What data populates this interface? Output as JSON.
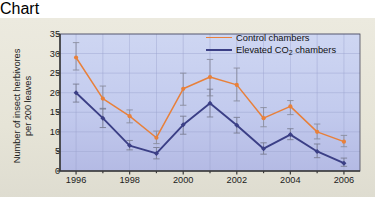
{
  "chart_data": {
    "type": "line",
    "title": "",
    "xlabel": "Year",
    "ylabel_line1": "Number of insect herbivores",
    "ylabel_line2": "per 200 leaves",
    "x": [
      1996,
      1997,
      1998,
      1999,
      2000,
      2001,
      2002,
      2003,
      2004,
      2005,
      2006
    ],
    "xtick_labels": [
      "1996",
      "1998",
      "2000",
      "2002",
      "2004",
      "2006"
    ],
    "xtick_values": [
      1996,
      1998,
      2000,
      2002,
      2004,
      2006
    ],
    "xlim": [
      1995.4,
      2006.6
    ],
    "ytick_labels": [
      "0",
      "5",
      "10",
      "15",
      "20",
      "25",
      "30",
      "35"
    ],
    "ytick_values": [
      0,
      5,
      10,
      15,
      20,
      25,
      30,
      35
    ],
    "ylim": [
      0,
      35
    ],
    "grid": true,
    "legend_position": "top-right",
    "series": [
      {
        "name": "Control chambers",
        "color": "#e8803a",
        "marker": "circle",
        "values": [
          29.0,
          18.5,
          14.0,
          8.5,
          21.0,
          24.0,
          22.0,
          13.5,
          16.5,
          10.0,
          7.5
        ],
        "err_low": [
          25.8,
          15.8,
          12.3,
          7.0,
          16.8,
          19.2,
          17.9,
          11.3,
          14.4,
          8.2,
          6.2
        ],
        "err_high": [
          32.8,
          21.7,
          15.6,
          10.2,
          25.0,
          28.5,
          26.3,
          16.2,
          18.0,
          12.0,
          9.1
        ]
      },
      {
        "name": "Elevated CO2 chambers",
        "color": "#3b3f86",
        "marker": "diamond",
        "values": [
          20.0,
          13.5,
          6.5,
          4.5,
          11.8,
          17.3,
          11.7,
          5.7,
          9.3,
          5.0,
          2.0
        ],
        "err_low": [
          17.6,
          11.1,
          5.4,
          3.1,
          9.4,
          13.8,
          9.7,
          4.3,
          8.0,
          3.4,
          1.2
        ],
        "err_high": [
          22.2,
          16.0,
          7.8,
          6.0,
          14.0,
          20.9,
          13.7,
          7.2,
          10.8,
          6.9,
          3.3
        ]
      }
    ],
    "legend": [
      {
        "label": "Control chambers",
        "color": "#e8803a"
      },
      {
        "label_prefix": "Elevated CO",
        "label_sub": "2",
        "label_suffix": " chambers",
        "color": "#3b3f86"
      }
    ],
    "colors": {
      "control": "#e8803a",
      "elevated": "#3b3f86",
      "plot_background_top": "#ccd4f0",
      "plot_background_bottom": "#b9bfe8",
      "grid": "#9aa3cf",
      "axis": "#3a3a3a",
      "page_background": "#e7e5d9"
    }
  }
}
